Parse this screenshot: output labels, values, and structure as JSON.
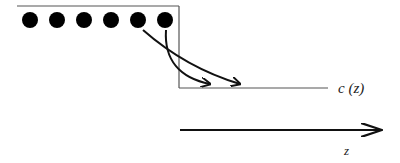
{
  "diagram": {
    "colors": {
      "stroke": "#111111",
      "frame": "#555555",
      "dot": "#000000",
      "background": "#ffffff"
    },
    "particles": {
      "count": 6,
      "icon": "filled-circle"
    },
    "labels": {
      "concentration": "c (z)",
      "axis": "z"
    }
  }
}
